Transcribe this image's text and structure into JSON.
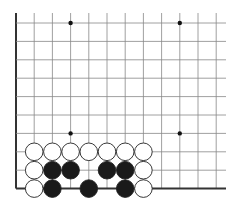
{
  "board": {
    "description": "Go problem diagram, lower-left corner section",
    "origin_x": 16,
    "origin_y": 23,
    "spacing_x": 18.2,
    "spacing_y": 18.4,
    "columns": 12,
    "rows": 10,
    "right_extent": 226,
    "top_extent": 13,
    "left_edge": true,
    "bottom_edge": true,
    "line_color": "#888888",
    "edge_color": "#333333",
    "star_points": [
      {
        "col": 3,
        "row": 0
      },
      {
        "col": 9,
        "row": 0
      },
      {
        "col": 3,
        "row": 6
      },
      {
        "col": 9,
        "row": 6
      }
    ],
    "stones": [
      {
        "color": "white",
        "col": 1,
        "row": 7
      },
      {
        "color": "white",
        "col": 2,
        "row": 7
      },
      {
        "color": "white",
        "col": 3,
        "row": 7
      },
      {
        "color": "white",
        "col": 4,
        "row": 7
      },
      {
        "color": "white",
        "col": 5,
        "row": 7
      },
      {
        "color": "white",
        "col": 6,
        "row": 7
      },
      {
        "color": "white",
        "col": 7,
        "row": 7
      },
      {
        "color": "white",
        "col": 1,
        "row": 8
      },
      {
        "color": "black",
        "col": 2,
        "row": 8
      },
      {
        "color": "black",
        "col": 3,
        "row": 8
      },
      {
        "color": "black",
        "col": 5,
        "row": 8
      },
      {
        "color": "black",
        "col": 6,
        "row": 8
      },
      {
        "color": "white",
        "col": 7,
        "row": 8
      },
      {
        "color": "white",
        "col": 1,
        "row": 9
      },
      {
        "color": "black",
        "col": 2,
        "row": 9
      },
      {
        "color": "black",
        "col": 4,
        "row": 9
      },
      {
        "color": "black",
        "col": 6,
        "row": 9
      },
      {
        "color": "white",
        "col": 7,
        "row": 9
      }
    ]
  }
}
